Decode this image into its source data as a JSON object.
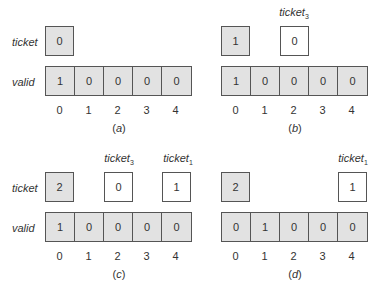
{
  "labels": {
    "ticket": "ticket",
    "valid": "valid",
    "ticket_base": "ticket"
  },
  "panels": [
    {
      "id": "a",
      "caption": "a",
      "ticket_value": "0",
      "valid": [
        "1",
        "0",
        "0",
        "0",
        "0"
      ],
      "indices": [
        "0",
        "1",
        "2",
        "3",
        "4"
      ],
      "thread_tickets": []
    },
    {
      "id": "b",
      "caption": "b",
      "ticket_value": "1",
      "valid": [
        "1",
        "0",
        "0",
        "0",
        "0"
      ],
      "indices": [
        "0",
        "1",
        "2",
        "3",
        "4"
      ],
      "thread_tickets": [
        {
          "thread": "3",
          "slot": 2,
          "value": "0"
        }
      ]
    },
    {
      "id": "c",
      "caption": "c",
      "ticket_value": "2",
      "valid": [
        "1",
        "0",
        "0",
        "0",
        "0"
      ],
      "indices": [
        "0",
        "1",
        "2",
        "3",
        "4"
      ],
      "thread_tickets": [
        {
          "thread": "3",
          "slot": 2,
          "value": "0"
        },
        {
          "thread": "1",
          "slot": 4,
          "value": "1"
        }
      ]
    },
    {
      "id": "d",
      "caption": "d",
      "ticket_value": "2",
      "valid": [
        "0",
        "1",
        "0",
        "0",
        "0"
      ],
      "indices": [
        "0",
        "1",
        "2",
        "3",
        "4"
      ],
      "thread_tickets": [
        {
          "thread": "1",
          "slot": 4,
          "value": "1"
        }
      ]
    }
  ]
}
